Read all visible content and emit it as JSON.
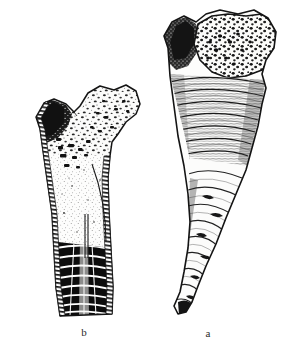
{
  "plate": {
    "background_color": "#ffffff",
    "ink_color": "#1a1a1a",
    "width": 300,
    "height": 355
  },
  "figures": [
    {
      "id": "fig-b",
      "label": "b",
      "view": "longitudinal-section",
      "description": "Vertical cross-section of a conical solitary coral showing flaring upper margin, porous wall, interior cavity and dense black tabulae at the base",
      "icon_name": "coral-longitudinal-section-illustration",
      "position": {
        "left": 14,
        "top": 82,
        "width": 140,
        "height": 250
      },
      "caption_position": {
        "left": 72,
        "top": 327
      }
    },
    {
      "id": "fig-a",
      "label": "a",
      "view": "exterior-lateral",
      "description": "Exterior lateral view of the same conical coral showing the pitted calice surface at top, horizontal growth annulations along the body and a tapering curved tip",
      "icon_name": "coral-exterior-view-illustration",
      "position": {
        "left": 150,
        "top": 8,
        "width": 145,
        "height": 325
      },
      "caption_position": {
        "left": 196,
        "top": 328
      }
    }
  ]
}
